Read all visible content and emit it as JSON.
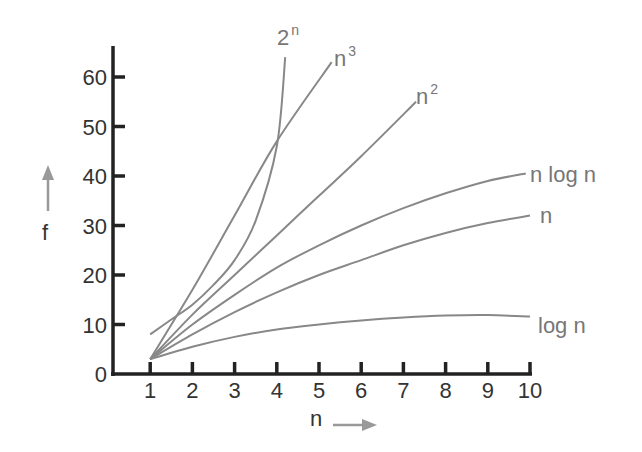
{
  "chart_data": {
    "type": "line",
    "title": "",
    "xlabel": "n",
    "ylabel": "f",
    "x_ticks": [
      "1",
      "2",
      "3",
      "4",
      "5",
      "6",
      "7",
      "8",
      "9",
      "10"
    ],
    "y_ticks": [
      "0",
      "10",
      "20",
      "30",
      "40",
      "50",
      "60"
    ],
    "xlim": [
      0,
      10
    ],
    "ylim": [
      0,
      65
    ],
    "grid": false,
    "legend": "inline labels at curve ends",
    "colors": {
      "axis": "#222222",
      "curve": "#888888",
      "arrow": "#999999",
      "label": "#777777"
    },
    "series": [
      {
        "name": "2^n",
        "label_base": "2",
        "label_sup": "n",
        "x": [
          1,
          1.5,
          2,
          2.5,
          3,
          3.5,
          4,
          4.2
        ],
        "y": [
          8,
          11,
          14,
          18,
          23,
          31,
          46,
          64
        ]
      },
      {
        "name": "n^3",
        "label_base": "n",
        "label_sup": "3",
        "x": [
          1,
          2,
          3,
          4,
          5.3
        ],
        "y": [
          3,
          17,
          32,
          47,
          63
        ]
      },
      {
        "name": "n^2",
        "label_base": "n",
        "label_sup": "2",
        "x": [
          1,
          2,
          3,
          4,
          5,
          6,
          7.3
        ],
        "y": [
          3,
          12,
          20,
          28,
          36,
          44,
          55
        ]
      },
      {
        "name": "n log n",
        "label_base": "n log n",
        "label_sup": "",
        "x": [
          1,
          2,
          3,
          4,
          5,
          6,
          7,
          8,
          9,
          9.9
        ],
        "y": [
          3,
          10,
          16,
          21.5,
          26,
          30,
          33.5,
          36.5,
          39,
          40.5
        ]
      },
      {
        "name": "n",
        "label_base": "n",
        "label_sup": "",
        "x": [
          1,
          2,
          3,
          4,
          5,
          6,
          7,
          8,
          9,
          10
        ],
        "y": [
          3,
          8,
          12.5,
          16.5,
          20,
          23,
          26,
          28.5,
          30.5,
          32
        ]
      },
      {
        "name": "log n",
        "label_base": "log n",
        "label_sup": "",
        "x": [
          1,
          2,
          3,
          4,
          5,
          6,
          7,
          8,
          9,
          10
        ],
        "y": [
          3,
          5.5,
          7.5,
          9,
          10,
          10.8,
          11.4,
          11.8,
          11.9,
          11.6
        ]
      }
    ]
  },
  "axes": {
    "x_title": "n",
    "y_title": "f"
  }
}
